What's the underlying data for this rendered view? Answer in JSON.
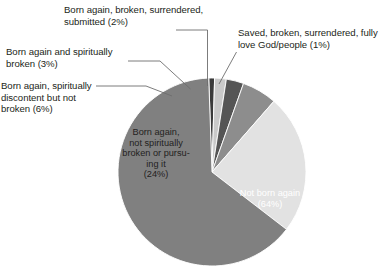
{
  "chart_data": {
    "type": "pie",
    "title": "",
    "subtitle": "",
    "xlabel": "",
    "ylabel": "",
    "legend_position": "none",
    "grid": false,
    "total_percent": 100,
    "start_angle_deg": -2,
    "direction": "clockwise",
    "categories": [
      "Saved, broken, surrendered, fully love God/people",
      "Born again, broken, surrendered, submitted",
      "Born again and spiritually broken",
      "Born again, spiritually discontent but not broken",
      "Born again, not spiritually broken or pursuing it",
      "Not born again"
    ],
    "values": [
      1,
      2,
      3,
      6,
      24,
      64
    ],
    "colors": [
      "#3b3b3b",
      "#c9c9c9",
      "#555555",
      "#8d8d8d",
      "#e2e2e2",
      "#808080"
    ],
    "slices": [
      {
        "label": "Saved, broken, surrendered, fully love God/people",
        "value": 1,
        "display": "Saved, broken, surrendered, fully\nlove God/people (1%)",
        "color": "#3b3b3b",
        "label_placement": "outside"
      },
      {
        "label": "Born again, broken, surrendered, submitted",
        "value": 2,
        "display": "Born again, broken, surrendered,\nsubmitted (2%)",
        "color": "#c9c9c9",
        "label_placement": "outside"
      },
      {
        "label": "Born again and spiritually broken",
        "value": 3,
        "display": "Born again and spiritually\nbroken (3%)",
        "color": "#555555",
        "label_placement": "outside"
      },
      {
        "label": "Born again, spiritually discontent but not broken",
        "value": 6,
        "display": "Born again, spiritually\ndiscontent but not\nbroken (6%)",
        "color": "#8d8d8d",
        "label_placement": "outside"
      },
      {
        "label": "Born again, not spiritually broken or pursuing it",
        "value": 24,
        "display": "Born again,\nnot spiritually\nbroken or pursu-\ning it\n(24%)",
        "color": "#e2e2e2",
        "label_placement": "inside"
      },
      {
        "label": "Not born again",
        "value": 64,
        "display": "Not born again\n(64%)",
        "color": "#808080",
        "label_placement": "inside"
      }
    ]
  },
  "labels": {
    "pct2": "Born again, broken, surrendered,\nsubmitted (2%)",
    "pct1": "Saved, broken, surrendered, fully\nlove God/people (1%)",
    "pct3": "Born again and spiritually\nbroken (3%)",
    "pct6": "Born again, spiritually\ndiscontent but not\nbroken (6%)",
    "pct24": "Born again,\nnot spiritually\nbroken or pursu-\ning it\n(24%)",
    "pct64": "Not born again\n(64%)"
  },
  "colors": {
    "background": "#ffffff",
    "text": "#231f20",
    "text_on_dark": "#ffffff",
    "leader_line": "#6d6d6d",
    "slice_outline": "#ffffff"
  }
}
